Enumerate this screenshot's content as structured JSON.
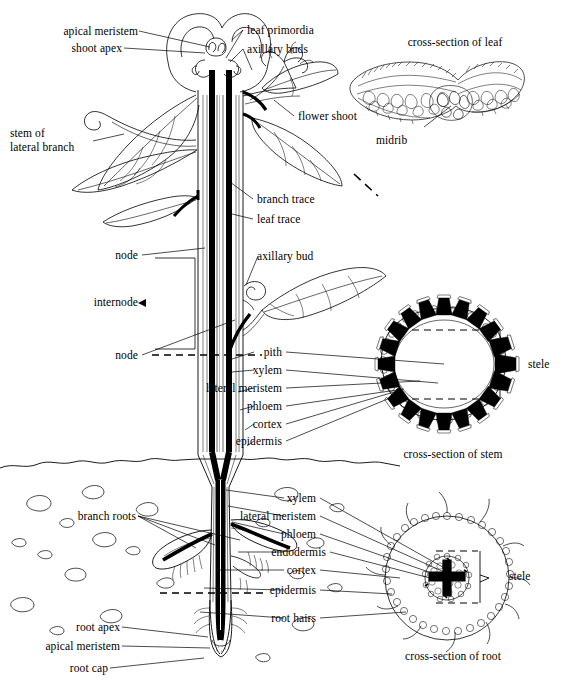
{
  "figure": {
    "ink_color": "#000000",
    "background_color": "#ffffff",
    "width": 561,
    "height": 695
  },
  "labels": {
    "apical_meristem_shoot": "apical meristem",
    "shoot_apex": "shoot apex",
    "leaf_primordia": "leaf primordia",
    "axillary_buds": "axillary buds",
    "cross_section_of_leaf": "cross-section of leaf",
    "stem_of_lateral_branch_1": "stem of",
    "stem_of_lateral_branch_2": "lateral branch",
    "flower_shoot": "flower shoot",
    "midrib": "midrib",
    "branch_trace": "branch trace",
    "leaf_trace": "leaf trace",
    "axillary_bud": "axillary bud",
    "node_upper": "node",
    "internode": "internode",
    "node_lower": "node",
    "pith": "pith",
    "xylem_stem": "xylem",
    "lateral_meristem_stem": "lateral meristem",
    "phloem_stem": "phloem",
    "cortex_stem": "cortex",
    "epidermis_stem": "epidermis",
    "stele_stem": "stele",
    "cross_section_of_stem": "cross-section of stem",
    "xylem_root": "xylem",
    "lateral_meristem_root": "lateral meristem",
    "phloem_root": "phloem",
    "endodermis": "endodermis",
    "cortex_root": "cortex",
    "epidermis_root": "epidermis",
    "root_hairs": "root hairs",
    "branch_roots": "branch roots",
    "root_apex": "root apex",
    "apical_meristem_root": "apical meristem",
    "root_cap": "root cap",
    "stele_root": "stele",
    "cross_section_of_root": "cross-section of root"
  },
  "diagram_parts": {
    "stem_cross_section": {
      "vascular_bundle_count": 20,
      "arrangement": "ring",
      "pith_location": "center",
      "bundle_fill": "#000000"
    },
    "root_cross_section": {
      "xylem_shape": "cross / star",
      "root_hair_count": 12,
      "stele_location": "center"
    },
    "leaf_cross_section": {
      "shape": "wing-like blade with central midrib",
      "tissue": "palisade and spongy mesophyll cells"
    }
  }
}
